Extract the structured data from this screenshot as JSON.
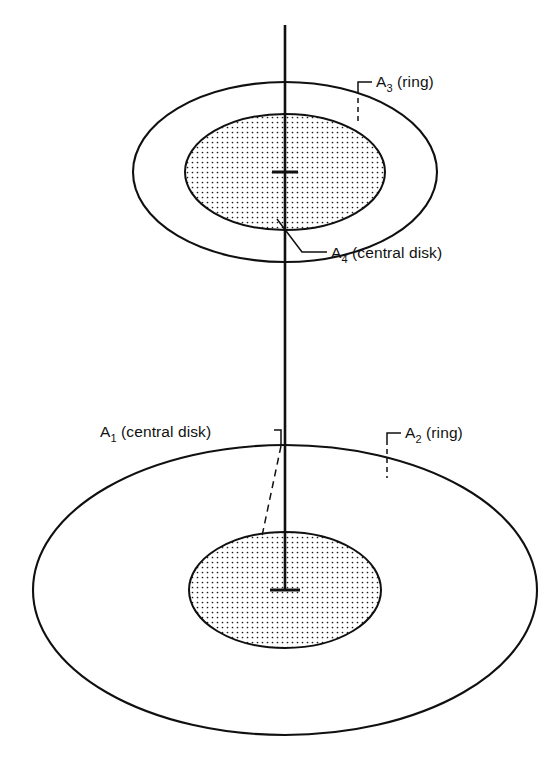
{
  "figure": {
    "background_color": "#ffffff",
    "ink_color": "#101010",
    "width": 550,
    "height": 764
  },
  "labels": {
    "a3": {
      "symbol": "A",
      "subscript": "3",
      "descriptor": "(ring)",
      "full": "A3 (ring)"
    },
    "a4": {
      "symbol": "A",
      "subscript": "4",
      "descriptor": "(central disk)",
      "full": "A4 (central disk)"
    },
    "a1": {
      "symbol": "A",
      "subscript": "1",
      "descriptor": "(central disk)",
      "full": "A1 (central disk)"
    },
    "a2": {
      "symbol": "A",
      "subscript": "2",
      "descriptor": "(ring)",
      "full": "A2 (ring)"
    }
  },
  "geometry": {
    "axis": {
      "x": 285,
      "top_y": 25,
      "bottom_y": 590
    },
    "upper_surface": {
      "center_x": 285,
      "center_y": 172,
      "outer_rx": 152,
      "outer_ry": 90,
      "inner_rx": 100,
      "inner_ry": 58
    },
    "lower_surface": {
      "center_x": 285,
      "center_y": 590,
      "outer_rx": 252,
      "outer_ry": 145,
      "inner_rx": 96,
      "inner_ry": 58
    }
  },
  "stipple": {
    "spacing": 5,
    "dot_radius": 0.85,
    "dot_color": "#1a1a1a"
  }
}
